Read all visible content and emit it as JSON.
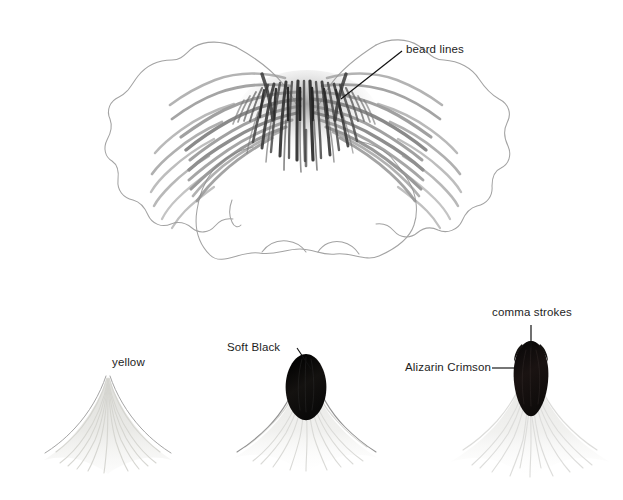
{
  "page": {
    "kind": "botanical-illustration-worksheet",
    "background_color": "#ffffff",
    "ink_color": "#1d1d1d"
  },
  "annotations": [
    {
      "id": "beard-lines",
      "label": "beard lines",
      "leader": "diagonal"
    },
    {
      "id": "comma-strokes",
      "label": "comma strokes",
      "leader": "vertical"
    },
    {
      "id": "alizarin-crimson",
      "label": "Alizarin Crimson",
      "leader": "horizontal"
    },
    {
      "id": "soft-black",
      "label": "Soft Black",
      "leader": "diagonal"
    },
    {
      "id": "yellow",
      "label": "yellow",
      "leader": "none"
    }
  ],
  "labels": {
    "beard_lines": "beard lines",
    "comma_strokes": "comma strokes",
    "alizarin_crimson": "Alizarin Crimson",
    "soft_black": "Soft Black",
    "yellow": "yellow"
  },
  "figures": [
    {
      "id": "main-flower",
      "name": "pansy-flower-drawing",
      "description": "outlined pansy bloom with dark radiating beard lines at the throat",
      "outline_color": "#9a9a9a",
      "stroke_color": "#4a4a4a"
    },
    {
      "id": "study-yellow",
      "name": "petal-study-yellow",
      "description": "pale triangular brushed petal form",
      "wash_color": "#e3e3e0"
    },
    {
      "id": "study-soft-black",
      "name": "petal-study-soft-black",
      "description": "pale petal with dark oval pod centre",
      "wash_color": "#e6e6e4",
      "mass_color": "#121212"
    },
    {
      "id": "study-alizarin-crimson",
      "name": "petal-study-alizarin-crimson",
      "description": "pale petal with tall dark teardrop centre and comma strokes",
      "wash_color": "#ececea",
      "mass_color": "#141210"
    }
  ],
  "palette": {
    "paper": "#ffffff",
    "graphite_light": "#b6b6b6",
    "graphite_mid": "#6d6d6d",
    "graphite_dark": "#3a3a3a",
    "wash_pale": "#e6e6e3",
    "near_black": "#111111"
  }
}
